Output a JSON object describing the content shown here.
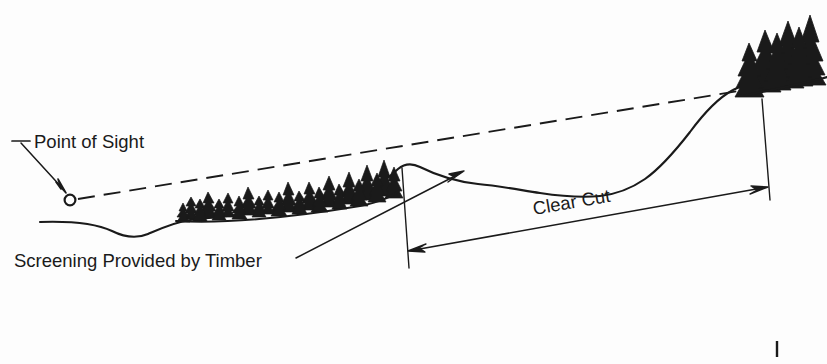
{
  "figure": {
    "kind": "terrain-cross-section-diagram",
    "background_color": "#fdfdfd",
    "ink_color": "#1a1a1a",
    "width": 827,
    "height": 364
  },
  "labels": {
    "point_of_sight": "Point of Sight",
    "screening_provided_by_timber": "Screening Provided by Timber",
    "clear_cut": "Clear Cut"
  },
  "annotations": {
    "point_of_sight_marker": "observer-eye-circle",
    "sight_line_style": "dashed",
    "clear_cut_dimension": "double-headed-arrow",
    "leader_line_screening": "arrow-pointing-to-terrain",
    "leader_line_point_of_sight": "arrow-pointing-to-observer"
  },
  "features": {
    "timber_band": "dense-conifer-stand",
    "ridge_timber": "conifer-stand-on-upper-ridge",
    "terrain": "ground-profile-line",
    "valley": "swale-left-of-timber"
  }
}
